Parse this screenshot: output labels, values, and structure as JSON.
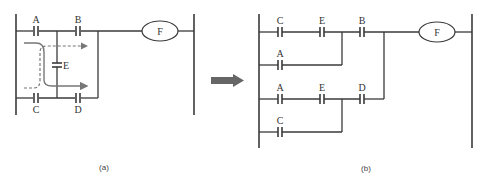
{
  "figure": {
    "panel_a": {
      "caption": "(a)",
      "contacts": {
        "A": "A",
        "B": "B",
        "C": "C",
        "D": "D",
        "E": "E"
      },
      "coil": "F",
      "current_paths": [
        "solid: A→E→D",
        "dashed: C→E→B"
      ]
    },
    "transform_arrow": "right-arrow",
    "panel_b": {
      "caption": "(b)",
      "rungs": [
        {
          "contacts": [
            "C",
            "E"
          ]
        },
        {
          "contacts": [
            "A"
          ]
        },
        {
          "contacts": [
            "A",
            "E"
          ]
        },
        {
          "contacts": [
            "C"
          ]
        }
      ],
      "series_contacts": {
        "top": "B",
        "bottom": "D"
      },
      "coil": "F"
    },
    "colors": {
      "line": "#3a3a3a",
      "path": "#777777",
      "arrow": "#666666"
    }
  }
}
